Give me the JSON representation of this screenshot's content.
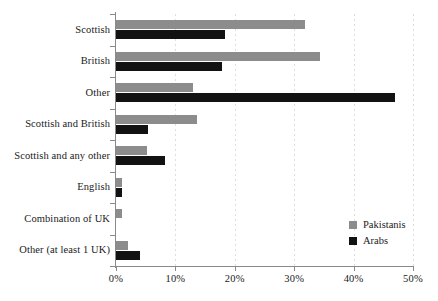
{
  "chart_data": {
    "type": "bar",
    "orientation": "horizontal",
    "title": "",
    "subtitle": "",
    "xlabel": "",
    "ylabel": "",
    "xlim": [
      0,
      50
    ],
    "xtick_labels": [
      "0%",
      "10%",
      "20%",
      "30%",
      "40%",
      "50%"
    ],
    "xtick_values": [
      0,
      10,
      20,
      30,
      40,
      50
    ],
    "grid": true,
    "grid_axis": "x",
    "grid_style": "dotted",
    "legend_position": "lower-right-inside",
    "categories": [
      "Scottish",
      "British",
      "Other",
      "Scottish and British",
      "Scottish and any other",
      "English",
      "Combination of UK",
      "Other (at least 1 UK)"
    ],
    "series": [
      {
        "name": "Pakistanis",
        "color": "#8c8c8c",
        "values": [
          31.8,
          34.3,
          13.0,
          13.6,
          5.2,
          1.0,
          1.0,
          2.0
        ]
      },
      {
        "name": "Arabs",
        "color": "#121212",
        "values": [
          18.3,
          17.8,
          47.0,
          5.4,
          8.2,
          1.0,
          0.0,
          4.0
        ]
      }
    ]
  },
  "legend": {
    "items": [
      {
        "label": "Pakistanis",
        "color": "#8c8c8c"
      },
      {
        "label": "Arabs",
        "color": "#121212"
      }
    ]
  },
  "colors": {
    "series_pakistanis": "#8c8c8c",
    "series_arabs": "#121212",
    "axis": "#8a8a8a",
    "grid": "#d8d8d8",
    "text": "#1a1a1a",
    "background": "#ffffff"
  }
}
